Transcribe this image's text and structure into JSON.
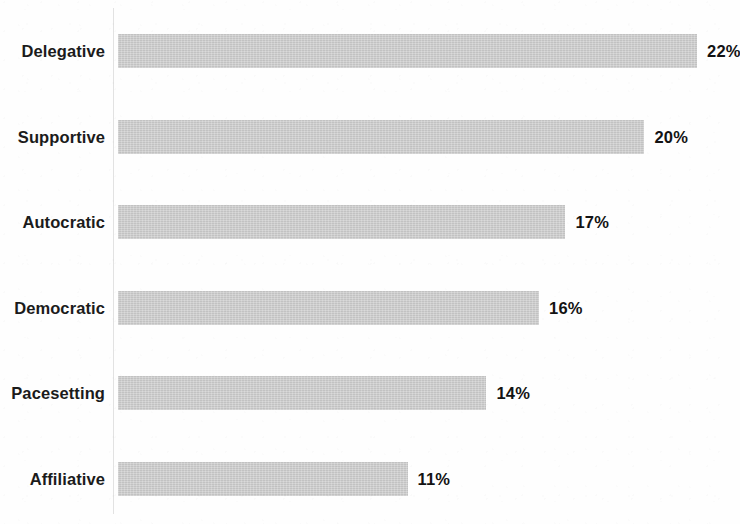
{
  "chart_data": {
    "type": "bar",
    "orientation": "horizontal",
    "title": "",
    "subtitle": "",
    "xlabel": "",
    "ylabel": "",
    "categories": [
      "Delegative",
      "Supportive",
      "Autocratic",
      "Democratic",
      "Pacesetting",
      "Affiliative"
    ],
    "values": [
      22,
      20,
      17,
      16,
      14,
      11
    ],
    "value_labels": [
      "22%",
      "20%",
      "17%",
      "16%",
      "14%",
      "11%"
    ],
    "units": "percent",
    "xlim": [
      0,
      23.6
    ],
    "ylim": null,
    "grid": false,
    "legend": false,
    "legend_position": "none",
    "tick_labels_x": [],
    "tick_labels_y": [
      "Delegative",
      "Supportive",
      "Autocratic",
      "Democratic",
      "Pacesetting",
      "Affiliative"
    ],
    "annotations": [],
    "series": [
      {
        "name": "Share",
        "values": [
          22,
          20,
          17,
          16,
          14,
          11
        ]
      }
    ]
  },
  "style": {
    "bar_color": "#c8c8c8",
    "text_color": "#1b1b1b",
    "value_text_color": "#131313",
    "axis_line_color": "#e2e2e2",
    "background_color": "#fefefe"
  },
  "geometry": {
    "axis_x": 113,
    "bar_start_x": 118,
    "px_per_unit": 26.32,
    "first_bar_top_y": 34,
    "row_pitch_y": 85.5,
    "bar_height": 34,
    "label_right_x": 105,
    "value_label_gap": 10
  }
}
